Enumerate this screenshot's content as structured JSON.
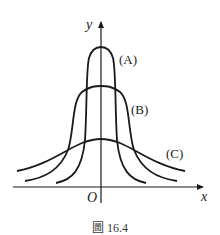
{
  "figure": {
    "caption": "圖 16.4",
    "axes": {
      "x_label": "x",
      "y_label": "y",
      "origin_label": "O"
    },
    "curves": [
      {
        "id": "A",
        "label": "(A)",
        "peak_height": "tallest",
        "width": "narrowest"
      },
      {
        "id": "B",
        "label": "(B)",
        "peak_height": "medium",
        "width": "medium"
      },
      {
        "id": "C",
        "label": "(C)",
        "peak_height": "lowest",
        "width": "widest"
      }
    ],
    "colors": {
      "stroke": "#1a1a1a",
      "background": "#ffffff"
    }
  }
}
